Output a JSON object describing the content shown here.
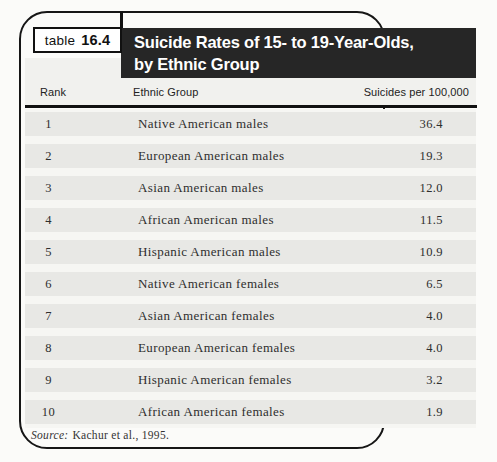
{
  "figure": {
    "tab_word": "table",
    "tab_number": "16.4",
    "title_line1": "Suicide Rates of 15- to 19-Year-Olds,",
    "title_line2": "by Ethnic Group",
    "source_label": "Source:",
    "source_text": "Kachur et al., 1995."
  },
  "table": {
    "columns": {
      "rank": "Rank",
      "group": "Ethnic Group",
      "rate": "Suicides per 100,000"
    },
    "rows": [
      {
        "rank": "1",
        "group": "Native American males",
        "rate": "36.4"
      },
      {
        "rank": "2",
        "group": "European American males",
        "rate": "19.3"
      },
      {
        "rank": "3",
        "group": "Asian American males",
        "rate": "12.0"
      },
      {
        "rank": "4",
        "group": "African American males",
        "rate": "11.5"
      },
      {
        "rank": "5",
        "group": "Hispanic American males",
        "rate": "10.9"
      },
      {
        "rank": "6",
        "group": "Native American females",
        "rate": "6.5"
      },
      {
        "rank": "7",
        "group": "Asian American females",
        "rate": "4.0"
      },
      {
        "rank": "8",
        "group": "European American females",
        "rate": "4.0"
      },
      {
        "rank": "9",
        "group": "Hispanic American females",
        "rate": "3.2"
      },
      {
        "rank": "10",
        "group": "African American females",
        "rate": "1.9"
      }
    ]
  },
  "colors": {
    "banner_bg": "#262626",
    "frame_border": "#161616",
    "header_band": "#f1f1ee",
    "row_band": "#e8e8e5",
    "row_gap": "#f6f6f3"
  }
}
